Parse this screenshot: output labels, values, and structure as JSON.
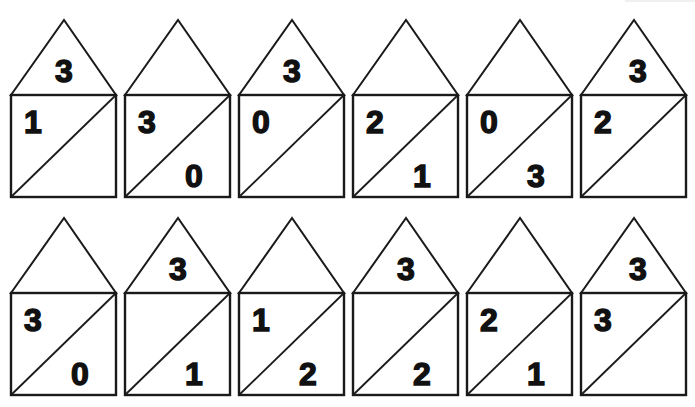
{
  "worksheet": {
    "rows": [
      {
        "houses": [
          {
            "roof": "3",
            "top_left": "1",
            "bottom_right": ""
          },
          {
            "roof": "",
            "top_left": "3",
            "bottom_right": "0"
          },
          {
            "roof": "3",
            "top_left": "0",
            "bottom_right": ""
          },
          {
            "roof": "",
            "top_left": "2",
            "bottom_right": "1"
          },
          {
            "roof": "",
            "top_left": "0",
            "bottom_right": "3"
          },
          {
            "roof": "3",
            "top_left": "2",
            "bottom_right": ""
          }
        ]
      },
      {
        "houses": [
          {
            "roof": "",
            "top_left": "3",
            "bottom_right": "0"
          },
          {
            "roof": "3",
            "top_left": "",
            "bottom_right": "1"
          },
          {
            "roof": "",
            "top_left": "1",
            "bottom_right": "2"
          },
          {
            "roof": "3",
            "top_left": "",
            "bottom_right": "2"
          },
          {
            "roof": "",
            "top_left": "2",
            "bottom_right": "1"
          },
          {
            "roof": "3",
            "top_left": "3",
            "bottom_right": ""
          }
        ]
      }
    ],
    "colors": {
      "line": "#1a1a1a",
      "background": "#ffffff",
      "digits": "#111111"
    }
  }
}
